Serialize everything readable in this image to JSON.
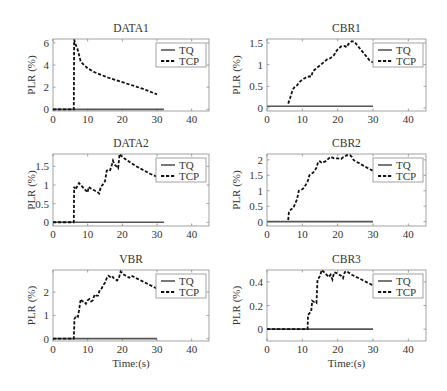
{
  "chart_data": [
    {
      "type": "line",
      "title": "DATA1",
      "xlabel": "",
      "ylabel": "PLR (%)",
      "xlim": [
        0,
        45
      ],
      "ylim": [
        -0.15,
        6.35
      ],
      "xticks": [
        0,
        10,
        20,
        30,
        40
      ],
      "yticks": [
        0,
        2,
        4,
        6
      ],
      "grid": false,
      "legend": {
        "location": "top-right",
        "entries": [
          "TQ",
          "TCP"
        ]
      },
      "series": [
        {
          "name": "TQ",
          "style": "solid",
          "color": "#555555",
          "x": [
            0,
            32
          ],
          "y": [
            0,
            0
          ]
        },
        {
          "name": "TCP",
          "style": "dashed",
          "color": "#111111",
          "x": [
            0,
            6,
            6.1,
            6.3,
            6.6,
            7,
            7.3,
            7.6,
            8,
            9,
            10,
            12,
            14,
            16,
            18,
            20,
            22,
            24,
            26,
            28,
            30
          ],
          "y": [
            0,
            0,
            6.3,
            6.1,
            5.8,
            5.5,
            5.2,
            4.8,
            4.3,
            4.0,
            3.7,
            3.35,
            3.1,
            2.85,
            2.65,
            2.45,
            2.25,
            2.05,
            1.85,
            1.6,
            1.35
          ]
        }
      ]
    },
    {
      "type": "line",
      "title": "CBR1",
      "xlabel": "",
      "ylabel": "PLR (%)",
      "xlim": [
        0,
        45
      ],
      "ylim": [
        -0.07,
        1.59
      ],
      "xticks": [
        0,
        10,
        20,
        30,
        40
      ],
      "yticks": [
        0,
        0.5,
        1,
        1.5
      ],
      "grid": false,
      "legend": {
        "location": "top-right",
        "entries": [
          "TQ",
          "TCP"
        ]
      },
      "series": [
        {
          "name": "TQ",
          "style": "solid",
          "color": "#555555",
          "x": [
            0,
            30
          ],
          "y": [
            0.04,
            0.04
          ]
        },
        {
          "name": "TCP",
          "style": "dashed",
          "color": "#111111",
          "x": [
            6,
            6.5,
            7,
            7.5,
            8,
            8.5,
            9,
            9.5,
            10,
            11,
            12,
            12.5,
            13,
            13.5,
            14,
            15,
            16,
            17,
            18,
            19,
            19.5,
            20,
            21,
            22,
            22.5,
            23,
            24,
            24.5,
            25,
            26,
            27,
            28,
            29,
            30
          ],
          "y": [
            0.1,
            0.22,
            0.35,
            0.45,
            0.5,
            0.52,
            0.58,
            0.62,
            0.65,
            0.7,
            0.73,
            0.72,
            0.85,
            0.88,
            0.92,
            0.98,
            1.05,
            1.12,
            1.15,
            1.22,
            1.3,
            1.35,
            1.42,
            1.43,
            1.4,
            1.47,
            1.54,
            1.53,
            1.5,
            1.4,
            1.3,
            1.2,
            1.1,
            1.05
          ]
        }
      ]
    },
    {
      "type": "line",
      "title": "DATA2",
      "xlabel": "",
      "ylabel": "PLR (%)",
      "xlim": [
        0,
        45
      ],
      "ylim": [
        -0.1,
        1.83
      ],
      "xticks": [
        0,
        10,
        20,
        30,
        40
      ],
      "yticks": [
        0,
        0.5,
        1,
        1.5
      ],
      "grid": false,
      "legend": {
        "location": "top-right",
        "entries": [
          "TQ",
          "TCP"
        ]
      },
      "series": [
        {
          "name": "TQ",
          "style": "solid",
          "color": "#555555",
          "x": [
            0,
            32
          ],
          "y": [
            0,
            0
          ]
        },
        {
          "name": "TCP",
          "style": "dashed",
          "color": "#111111",
          "x": [
            0,
            6,
            6.1,
            6.5,
            7,
            7.5,
            8,
            8.5,
            9,
            9.5,
            10,
            10.3,
            11,
            12,
            13,
            13.3,
            13.8,
            14.3,
            15,
            15.5,
            16,
            16.5,
            17,
            17.3,
            17.7,
            18.3,
            18.8,
            19.2,
            20,
            22,
            24,
            26,
            28,
            30
          ],
          "y": [
            0,
            0,
            0.95,
            0.88,
            0.97,
            1.05,
            1.0,
            0.95,
            0.9,
            0.85,
            0.8,
            0.95,
            0.9,
            0.85,
            0.8,
            0.77,
            0.95,
            1.0,
            1.1,
            1.38,
            1.42,
            1.4,
            1.55,
            1.65,
            1.55,
            1.5,
            1.45,
            1.83,
            1.75,
            1.62,
            1.5,
            1.4,
            1.3,
            1.22
          ]
        }
      ]
    },
    {
      "type": "line",
      "title": "CBR2",
      "xlabel": "",
      "ylabel": "PLR (%)",
      "xlim": [
        0,
        45
      ],
      "ylim": [
        -0.14,
        2.19
      ],
      "xticks": [
        0,
        10,
        20,
        30,
        40
      ],
      "yticks": [
        0,
        0.5,
        1,
        1.5,
        2
      ],
      "grid": false,
      "legend": {
        "location": "top-right",
        "entries": [
          "TQ",
          "TCP"
        ]
      },
      "series": [
        {
          "name": "TQ",
          "style": "solid",
          "color": "#555555",
          "x": [
            0,
            30
          ],
          "y": [
            0,
            0
          ]
        },
        {
          "name": "TCP",
          "style": "dashed",
          "color": "#111111",
          "x": [
            6,
            6.2,
            6.8,
            7.5,
            8,
            8.5,
            9,
            9.5,
            10,
            10.5,
            11,
            11.5,
            12,
            12.5,
            13,
            13.5,
            14,
            14.5,
            15,
            15.5,
            16,
            16.5,
            17,
            17.5,
            18,
            19,
            20,
            21,
            21.5,
            22,
            22.5,
            23,
            23.5,
            24,
            24.5,
            25,
            26,
            27,
            28,
            29,
            30
          ],
          "y": [
            0.05,
            0.3,
            0.4,
            0.45,
            0.6,
            0.72,
            1.0,
            1.02,
            1.05,
            1.1,
            1.2,
            1.3,
            1.5,
            1.55,
            1.58,
            1.65,
            1.75,
            1.95,
            1.95,
            1.9,
            1.93,
            1.95,
            2.0,
            2.05,
            2.1,
            2.05,
            2.05,
            2.03,
            2.08,
            2.1,
            2.15,
            2.15,
            2.15,
            2.1,
            2.0,
            1.95,
            1.9,
            1.83,
            1.77,
            1.7,
            1.65
          ]
        }
      ]
    },
    {
      "type": "line",
      "title": "VBR",
      "xlabel": "Time:(s)",
      "ylabel": "PLR (%)",
      "xlim": [
        0,
        45
      ],
      "ylim": [
        -0.1,
        2.95
      ],
      "xticks": [
        0,
        10,
        20,
        30,
        40
      ],
      "yticks": [
        0,
        1,
        2
      ],
      "grid": false,
      "legend": {
        "location": "top-right",
        "entries": [
          "TQ",
          "TCP"
        ]
      },
      "series": [
        {
          "name": "TQ",
          "style": "solid",
          "color": "#555555",
          "x": [
            0,
            30
          ],
          "y": [
            0,
            0
          ]
        },
        {
          "name": "TCP",
          "style": "dashed",
          "color": "#111111",
          "x": [
            0,
            6,
            6.2,
            6.8,
            7.2,
            7.6,
            8,
            8.5,
            9,
            9.5,
            10,
            10.5,
            11,
            11.5,
            12,
            12.5,
            13,
            13.5,
            14,
            14.5,
            15,
            15.5,
            16,
            16.5,
            17,
            17.5,
            18,
            18.5,
            19,
            19.5,
            20,
            21,
            22,
            22.5,
            23,
            24,
            26,
            28,
            30
          ],
          "y": [
            0,
            0,
            0.85,
            1.0,
            0.95,
            1.3,
            1.7,
            1.6,
            1.6,
            1.5,
            1.65,
            1.7,
            1.6,
            1.65,
            1.9,
            1.85,
            1.85,
            2.1,
            2.15,
            2.3,
            2.4,
            2.6,
            2.7,
            2.65,
            2.7,
            2.6,
            2.55,
            2.5,
            2.6,
            2.88,
            2.8,
            2.7,
            2.62,
            2.7,
            2.68,
            2.6,
            2.45,
            2.3,
            2.15
          ]
        }
      ]
    },
    {
      "type": "line",
      "title": "CBR3",
      "xlabel": "Time:(s)",
      "ylabel": "PLR (%)",
      "xlim": [
        0,
        45
      ],
      "ylim": [
        -0.1,
        0.5
      ],
      "xticks": [
        0,
        10,
        20,
        30,
        40
      ],
      "yticks": [
        0,
        0.2,
        0.4
      ],
      "grid": false,
      "legend": {
        "location": "top-right",
        "entries": [
          "TQ",
          "TCP"
        ]
      },
      "series": [
        {
          "name": "TQ",
          "style": "solid",
          "color": "#555555",
          "x": [
            0,
            30
          ],
          "y": [
            0,
            0
          ]
        },
        {
          "name": "TCP",
          "style": "dashed",
          "color": "#111111",
          "x": [
            0,
            11.5,
            11.6,
            12.5,
            12.8,
            13.3,
            14,
            14.3,
            14.6,
            15,
            15.5,
            16.5,
            17.5,
            18,
            18.5,
            19,
            20,
            21,
            21.5,
            22,
            22.5,
            24,
            26,
            28,
            30
          ],
          "y": [
            0,
            0,
            0.12,
            0.15,
            0.24,
            0.23,
            0.22,
            0.42,
            0.43,
            0.45,
            0.5,
            0.47,
            0.44,
            0.46,
            0.42,
            0.48,
            0.47,
            0.45,
            0.43,
            0.48,
            0.49,
            0.46,
            0.43,
            0.4,
            0.37
          ]
        }
      ]
    }
  ]
}
